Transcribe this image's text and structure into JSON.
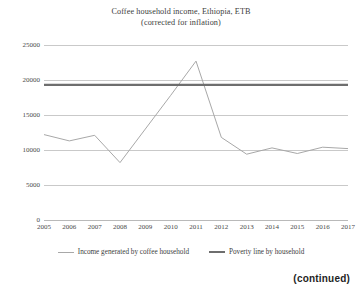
{
  "figure": {
    "title_line_1": "Coffee household income, Ethiopia, ETB",
    "title_line_2": "(corrected for inflation)",
    "continued_note": "(continued)"
  },
  "legend": {
    "position": "bottom-center",
    "entries": [
      {
        "label": "Income generated by coffee household",
        "color": "#a8a8a8",
        "style": "thin"
      },
      {
        "label": "Poverty line by household",
        "color": "#6e6e6e",
        "style": "thick"
      }
    ]
  },
  "chart_data": {
    "type": "line",
    "title": "Coffee household income, Ethiopia, ETB (corrected for inflation)",
    "xlabel": "",
    "ylabel": "",
    "grid": true,
    "legend_position": "bottom-center",
    "x": [
      2005,
      2006,
      2007,
      2008,
      2009,
      2010,
      2011,
      2012,
      2013,
      2014,
      2015,
      2016,
      2017
    ],
    "categories": [
      "2005",
      "2006",
      "2007",
      "2008",
      "2009",
      "2010",
      "2011",
      "2012",
      "2013",
      "2014",
      "2015",
      "2016",
      "2017"
    ],
    "xlim": [
      2005,
      2017
    ],
    "ylim": [
      0,
      25000
    ],
    "yticks": [
      0,
      5000,
      10000,
      15000,
      20000,
      25000
    ],
    "ytick_labels": [
      "0",
      "5000",
      "10000",
      "15000",
      "20000",
      "25000"
    ],
    "series": [
      {
        "name": "Income generated by coffee household",
        "color": "#a8a8a8",
        "width": 1,
        "values": [
          12200,
          11300,
          12100,
          8200,
          13000,
          17800,
          22700,
          11800,
          9400,
          10300,
          9500,
          10400,
          10200
        ]
      },
      {
        "name": "Poverty line by household",
        "color": "#6e6e6e",
        "width": 2.2,
        "values": [
          19300,
          19300,
          19300,
          19300,
          19300,
          19300,
          19300,
          19300,
          19300,
          19300,
          19300,
          19300,
          19300
        ]
      }
    ]
  }
}
